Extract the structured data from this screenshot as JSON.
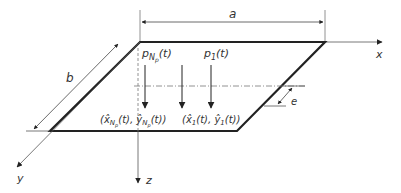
{
  "diagram": {
    "labels": {
      "a": "a",
      "b": "b",
      "x": "x",
      "y": "y",
      "z": "z",
      "e": "e"
    },
    "loads": [
      {
        "name": "p_Np",
        "base": "p",
        "sub": "N",
        "subsub": "p",
        "arg": "(t)"
      },
      {
        "name": "p_1",
        "base": "p",
        "sub": "1",
        "arg": "(t)"
      }
    ],
    "positions": [
      {
        "name": "pos_Np",
        "text_open": "(x̂",
        "sub": "N",
        "subsub": "p",
        "mid": "(t), ŷ",
        "sub2": "N",
        "subsub2": "p",
        "close": "(t))"
      },
      {
        "name": "pos_1",
        "text_open": "(x̂",
        "sub": "1",
        "mid": "(t), ŷ",
        "sub2": "1",
        "close": "(t))"
      }
    ],
    "colors": {
      "plate_edge": "#222222",
      "axis": "#555555",
      "dash": "#777777"
    }
  }
}
